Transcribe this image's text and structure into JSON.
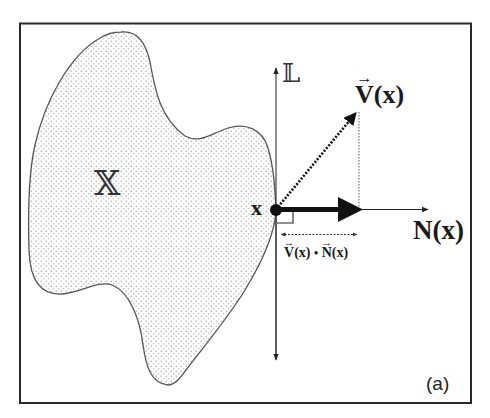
{
  "figure": {
    "panel_label": "(a)",
    "region_label": "𝕏",
    "line_label": "𝕃",
    "point_label": "x",
    "vector_v_label": {
      "symbol": "V",
      "arg": "(x)",
      "arrow": "→"
    },
    "normal_label": {
      "symbol": "N",
      "arg": "(x)"
    },
    "projection_label": {
      "v_symbol": "V",
      "v_arg": "(x)",
      "dot": "•",
      "n_symbol": "N",
      "n_arg": "(x)",
      "arrow": "→"
    },
    "colors": {
      "frame": "#2a2a2a",
      "outline": "#555555",
      "stipple": "#9a9a9a",
      "arrow": "#111111",
      "text": "#1a1a1a"
    }
  }
}
